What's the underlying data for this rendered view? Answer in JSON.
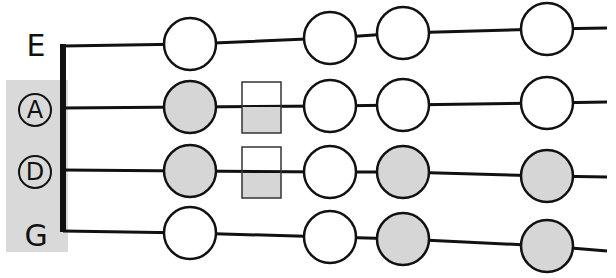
{
  "strings": {
    "E": {
      "label": "E",
      "circled": false
    },
    "A": {
      "label": "A",
      "circled": true
    },
    "D": {
      "label": "D",
      "circled": true
    },
    "G": {
      "label": "G",
      "circled": false
    }
  },
  "colors": {
    "filled": "#d6d6d6",
    "open": "#ffffff",
    "stroke": "#111111",
    "highlight_box": "#d9d9d9"
  },
  "notes": {
    "E": [
      "open",
      "open",
      "open",
      "open"
    ],
    "A": [
      "filled",
      "half-square",
      "open",
      "open",
      "open"
    ],
    "D": [
      "filled",
      "half-square",
      "open",
      "filled",
      "filled"
    ],
    "G": [
      "open",
      "open",
      "filled",
      "filled"
    ]
  }
}
